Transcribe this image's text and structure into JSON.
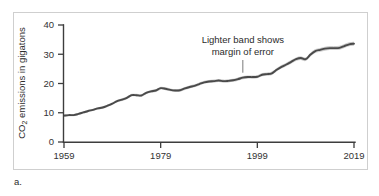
{
  "figure": {
    "caption": "a.",
    "border_color": "#cfcfcf",
    "background": "#ffffff"
  },
  "annotation": {
    "line1": "Lighter band shows",
    "line2": "margin of error"
  },
  "chart_data": {
    "type": "line",
    "title": "",
    "xlabel": "",
    "ylabel": "CO2 emissions in gigatons",
    "ylabel_display": "CO₂ emissions in gigatons",
    "xlim": [
      1959,
      2019
    ],
    "ylim": [
      0,
      40
    ],
    "grid": false,
    "legend": "none",
    "line_color": "#4a4a4a",
    "band_color": "#c9c9c9",
    "xticks": [
      1959,
      1979,
      1999,
      2019
    ],
    "xtick_labels": [
      "1959",
      "1979",
      "1999",
      "2019"
    ],
    "yticks": [
      0,
      10,
      20,
      30,
      40
    ],
    "ytick_labels": [
      "0",
      "10",
      "20",
      "30",
      "40"
    ],
    "annotations": [
      {
        "text": "Lighter band shows margin of error",
        "points_to_year": 1996,
        "points_to_value": 23.0
      }
    ],
    "series": [
      {
        "name": "CO2 emissions",
        "band_half_width": 0.7,
        "x": [
          1959,
          1960,
          1961,
          1962,
          1963,
          1964,
          1965,
          1966,
          1967,
          1968,
          1969,
          1970,
          1971,
          1972,
          1973,
          1974,
          1975,
          1976,
          1977,
          1978,
          1979,
          1980,
          1981,
          1982,
          1983,
          1984,
          1985,
          1986,
          1987,
          1988,
          1989,
          1990,
          1991,
          1992,
          1993,
          1994,
          1995,
          1996,
          1997,
          1998,
          1999,
          2000,
          2001,
          2002,
          2003,
          2004,
          2005,
          2006,
          2007,
          2008,
          2009,
          2010,
          2011,
          2012,
          2013,
          2014,
          2015,
          2016,
          2017,
          2018,
          2019
        ],
        "values": [
          9.0,
          9.2,
          9.2,
          9.6,
          10.1,
          10.6,
          11.0,
          11.5,
          11.8,
          12.4,
          13.1,
          14.0,
          14.5,
          15.1,
          16.0,
          16.0,
          15.9,
          16.8,
          17.3,
          17.6,
          18.4,
          18.2,
          17.8,
          17.6,
          17.7,
          18.3,
          18.8,
          19.2,
          19.8,
          20.4,
          20.7,
          20.8,
          21.0,
          20.8,
          20.9,
          21.1,
          21.5,
          22.0,
          22.2,
          22.2,
          22.3,
          23.0,
          23.2,
          23.5,
          24.7,
          25.7,
          26.5,
          27.4,
          28.3,
          28.7,
          28.3,
          29.9,
          31.1,
          31.5,
          31.9,
          32.1,
          32.1,
          32.2,
          32.8,
          33.4,
          33.6
        ]
      }
    ]
  }
}
